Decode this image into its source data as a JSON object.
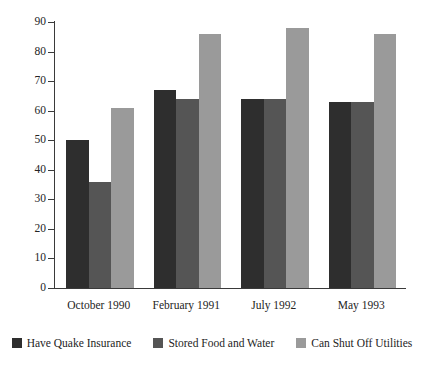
{
  "chart_data": {
    "type": "bar",
    "title": "",
    "subtitle": "",
    "xlabel": "",
    "ylabel": "",
    "ylim": [
      0,
      90
    ],
    "yticks": [
      0,
      10,
      20,
      30,
      40,
      50,
      60,
      70,
      80,
      90
    ],
    "grid": false,
    "legend_position": "bottom",
    "categories": [
      "October 1990",
      "February 1991",
      "July 1992",
      "May 1993"
    ],
    "series": [
      {
        "name": "Have Quake Insurance",
        "color": "#2e2e2e",
        "values": [
          50,
          67,
          64,
          63
        ]
      },
      {
        "name": "Stored Food and Water",
        "color": "#555555",
        "values": [
          36,
          64,
          64,
          63
        ]
      },
      {
        "name": "Can Shut Off Utilities",
        "color": "#9a9a9a",
        "values": [
          61,
          86,
          88,
          86
        ]
      }
    ]
  }
}
